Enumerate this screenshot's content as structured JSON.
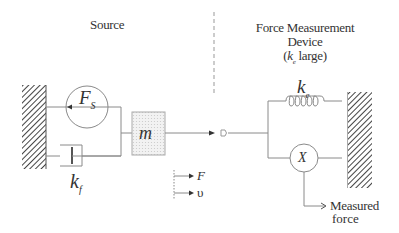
{
  "diagram": {
    "source_heading": "Source",
    "device_heading": {
      "line1": "Force Measurement",
      "line2": "Device",
      "line3_prefix": "(",
      "line3_symbol": "k",
      "line3_sub": "e",
      "line3_suffix": " large)"
    },
    "source_force": {
      "symbol": "F",
      "sub": "S"
    },
    "mass": {
      "symbol": "m"
    },
    "damper": {
      "symbol": "k",
      "sub": "f"
    },
    "spring": {
      "symbol": "k",
      "sub": "e"
    },
    "transducer": {
      "symbol": "X"
    },
    "legend": {
      "force": "F",
      "velocity": "υ"
    },
    "output_label": {
      "line1": "Measured",
      "line2": "force"
    },
    "colors": {
      "line": "#8a8a8a",
      "hatch": "#444444",
      "mass_fill": "#ececec",
      "text": "#333333"
    }
  }
}
